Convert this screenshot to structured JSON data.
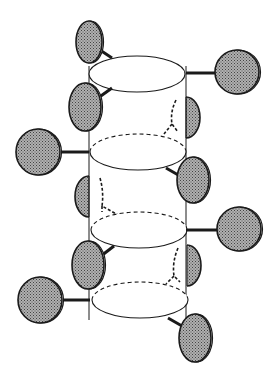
{
  "diagram": {
    "type": "helical-cylinder-with-spheres",
    "colors": {
      "background": "#ffffff",
      "stroke": "#1a1a1a",
      "sphere_fill": "#8c8c8c"
    },
    "cylinder": {
      "left_x": 89,
      "right_x": 186,
      "top_y": 66,
      "bottom_y": 320,
      "discs": [
        {
          "cx": 137,
          "cy": 74,
          "rx": 48,
          "ry": 18,
          "front_dashed": false,
          "back_dashed": false
        },
        {
          "cx": 138,
          "cy": 152,
          "rx": 48,
          "ry": 18,
          "front_dashed": false,
          "back_dashed": true
        },
        {
          "cx": 139,
          "cy": 230,
          "rx": 48,
          "ry": 18,
          "front_dashed": false,
          "back_dashed": true
        },
        {
          "cx": 140,
          "cy": 300,
          "rx": 48,
          "ry": 18,
          "front_dashed": false,
          "back_dashed": true
        }
      ]
    },
    "spheres": [
      {
        "name": "sphere-top-left",
        "cx": 89,
        "cy": 42,
        "rx": 13,
        "ry": 21,
        "bond": [
          100,
          50,
          112,
          58
        ]
      },
      {
        "name": "sphere-top-right",
        "cx": 237,
        "cy": 72,
        "rx": 22,
        "ry": 22,
        "bond": [
          186,
          73,
          215,
          73
        ]
      },
      {
        "name": "sphere-mid-left-1",
        "cx": 85,
        "cy": 107,
        "rx": 16,
        "ry": 24,
        "bond": [
          98,
          98,
          112,
          88
        ]
      },
      {
        "name": "sphere-far-left-1",
        "cx": 38,
        "cy": 152,
        "rx": 22,
        "ry": 23,
        "bond": [
          60,
          152,
          89,
          152
        ]
      },
      {
        "name": "sphere-lower-right-1",
        "cx": 193,
        "cy": 180,
        "rx": 16,
        "ry": 23,
        "bond": [
          166,
          168,
          180,
          176
        ]
      },
      {
        "name": "sphere-right-2",
        "cx": 239,
        "cy": 229,
        "rx": 22,
        "ry": 22,
        "bond": [
          186,
          230,
          217,
          230
        ]
      },
      {
        "name": "sphere-mid-left-2",
        "cx": 88,
        "cy": 265,
        "rx": 16,
        "ry": 24,
        "bond": [
          101,
          256,
          114,
          246
        ]
      },
      {
        "name": "sphere-far-left-2",
        "cx": 40,
        "cy": 300,
        "rx": 22,
        "ry": 23,
        "bond": [
          62,
          300,
          90,
          300
        ]
      },
      {
        "name": "sphere-bottom-right",
        "cx": 195,
        "cy": 338,
        "rx": 16,
        "ry": 24,
        "bond": [
          168,
          318,
          182,
          326
        ]
      }
    ],
    "half_spheres": [
      {
        "name": "half-sphere-right-1",
        "x": 186,
        "top": 97,
        "bottom": 138,
        "bulge": 14
      },
      {
        "name": "half-sphere-left-1",
        "x": 89,
        "top": 176,
        "bottom": 217,
        "bulge": -14
      },
      {
        "name": "half-sphere-right-2",
        "x": 187,
        "top": 245,
        "bottom": 286,
        "bulge": 14
      }
    ],
    "hidden_bonds": [
      {
        "name": "hidden-bond-1",
        "path": "M 176 100 Q 170 112 172 124 L 178 132 M 172 124 L 164 134"
      },
      {
        "name": "hidden-bond-2",
        "path": "M 100 178 Q 104 192 102 206 L 118 215 M 102 206 L 102 212"
      },
      {
        "name": "hidden-bond-3",
        "path": "M 178 248 Q 172 262 174 276 L 180 282 M 174 276 L 166 284"
      }
    ]
  }
}
